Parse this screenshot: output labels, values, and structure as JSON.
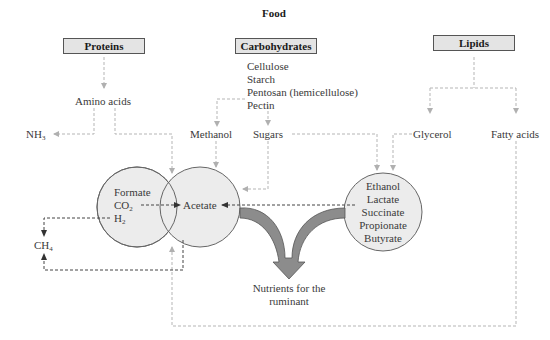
{
  "title": "Food",
  "sources": {
    "proteins": "Proteins",
    "carbohydrates": "Carbohydrates",
    "lipids": "Lipids"
  },
  "carbohydrate_list": [
    "Cellulose",
    "Starch",
    "Pentosan (hemicellulose)",
    "Pectin"
  ],
  "intermediates": {
    "amino_acids": "Amino acids",
    "nh3": "NH",
    "nh3_sub": "3",
    "methanol": "Methanol",
    "sugars": "Sugars",
    "glycerol": "Glycerol",
    "fatty_acids": "Fatty acids"
  },
  "left_circle": {
    "formate": "Formate",
    "co2": "CO",
    "co2_sub": "2",
    "h2": "H",
    "h2_sub": "2"
  },
  "center_circle": {
    "acetate": "Acetate"
  },
  "right_circle": {
    "items": [
      "Ethanol",
      "Lactate",
      "Succinate",
      "Propionate",
      "Butyrate"
    ]
  },
  "methane": {
    "ch4": "CH",
    "ch4_sub": "4"
  },
  "output": {
    "line1": "Nutrients for the",
    "line2": "ruminant"
  },
  "colors": {
    "circle_fill": "#ececec",
    "circle_stroke": "#666666",
    "big_arrow_fill": "#8c8c8c",
    "box_fill": "#e4e4e4",
    "dashed_grey": "#b5b5b5",
    "dashed_dark": "#444444"
  }
}
